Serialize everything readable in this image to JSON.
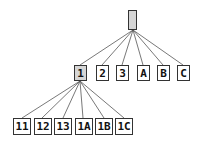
{
  "tree": {
    "root": {
      "label": "",
      "selected": true
    },
    "level1": [
      {
        "label": "1",
        "selected": true
      },
      {
        "label": "2",
        "selected": false
      },
      {
        "label": "3",
        "selected": false
      },
      {
        "label": "A",
        "selected": false
      },
      {
        "label": "B",
        "selected": false
      },
      {
        "label": "C",
        "selected": false
      }
    ],
    "level2": [
      {
        "label": "11"
      },
      {
        "label": "12"
      },
      {
        "label": "13"
      },
      {
        "label": "1A"
      },
      {
        "label": "1B"
      },
      {
        "label": "1C"
      }
    ]
  },
  "colors": {
    "selected_fill": "#d6d6d6",
    "border": "#333333",
    "edge": "#555555"
  }
}
